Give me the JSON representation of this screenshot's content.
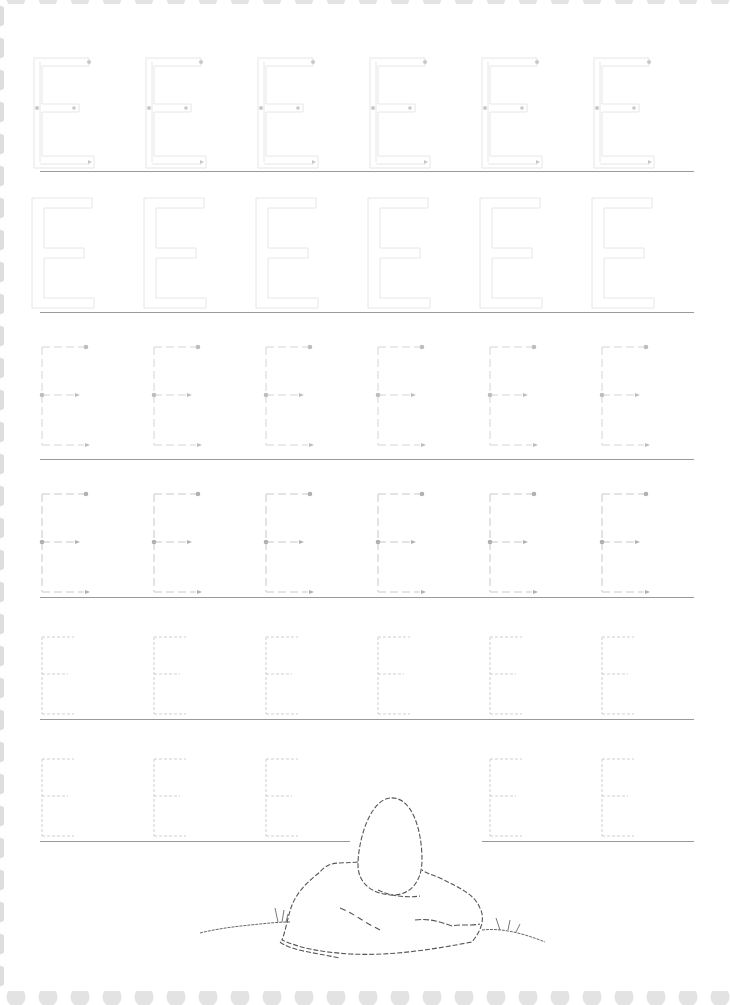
{
  "worksheet": {
    "letter": "E",
    "letters_per_row": 6,
    "border": {
      "style": "scalloped",
      "color": "#e0e0e0",
      "sides": [
        "top",
        "left",
        "bottom"
      ]
    },
    "baseline_color": "#9a9a9a",
    "rows": [
      {
        "style": "outline-with-stroke-guides",
        "count": 6,
        "stroke_color": "#e6e6e6",
        "dot_color": "#c8c8c8"
      },
      {
        "style": "outline",
        "count": 6,
        "stroke_color": "#e6e6e6"
      },
      {
        "style": "dashed-with-arrows",
        "count": 6,
        "stroke_color": "#d4d4d4",
        "dot_color": "#bdbdbd"
      },
      {
        "style": "dashed-with-arrows",
        "count": 6,
        "stroke_color": "#c8c8c8",
        "dot_color": "#b0b0b0"
      },
      {
        "style": "dotted",
        "count": 6,
        "stroke_color": "#cfcfcf"
      },
      {
        "style": "dotted",
        "count": 5,
        "stroke_color": "#cfcfcf",
        "note": "fourth position replaced by illustration"
      }
    ],
    "illustration": {
      "subject": "egg-on-rock",
      "description": "Dashed line drawing of an egg resting on a rock with grass"
    }
  }
}
